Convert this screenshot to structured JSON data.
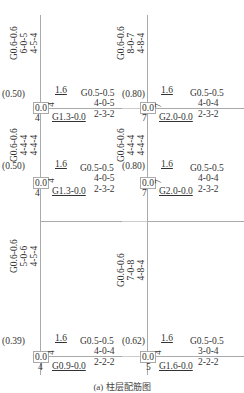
{
  "figure": {
    "caption": "(a) 柱层配筋图"
  },
  "columns": [
    {
      "side": "left",
      "segments": [
        {
          "vertical_label": [
            "G0.6-0.6",
            "6-0-5",
            "4-5-4"
          ]
        },
        {
          "vertical_label": [
            "G0.6-0.6",
            "4-4-4",
            "4-4-4"
          ]
        },
        {
          "vertical_label": [
            "G0.6-0.6",
            "5-0-6",
            "4-5-4"
          ]
        }
      ],
      "joints": [
        {
          "ratio": "(0.50)",
          "box": "0.0",
          "top_small": "1.6",
          "side_small": "4",
          "bottom_small": "4",
          "beam_bottom": "G1.3-0.0",
          "beam_label": [
            "G0.5-0.5",
            "4-0-5",
            "2-3-2"
          ]
        },
        {
          "ratio": "(0.50)",
          "box": "0.0",
          "top_small": "1.6",
          "side_small": "4",
          "bottom_small": "4",
          "beam_bottom": "G1.3-0.0",
          "beam_label": [
            "G0.5-0.5",
            "4-0-5",
            "2-3-2"
          ]
        },
        {
          "ratio": "(0.39)",
          "box": "0.0",
          "top_small": "1.6",
          "side_small": "4",
          "bottom_small": "4",
          "beam_bottom": "G0.9-0.0",
          "beam_label": [
            "G0.5-0.5",
            "4-0-4",
            "2-2-2"
          ]
        }
      ]
    },
    {
      "side": "right",
      "segments": [
        {
          "vertical_label": [
            "G0.6-0.6",
            "8-0-7",
            "4-8-4"
          ]
        },
        {
          "vertical_label": [
            "G0.6-0.6",
            "4-4-4",
            "4-4-4"
          ]
        },
        {
          "vertical_label": [
            "G0.6-0.6",
            "7-0-8",
            "4-8-4"
          ]
        }
      ],
      "joints": [
        {
          "ratio": "(0.80)",
          "box": "0.0",
          "top_small": "1.6",
          "side_small": "7",
          "bottom_small": "7",
          "beam_bottom": "G2.0-0.0",
          "beam_label": [
            "G0.5-0.5",
            "4-0-4",
            "2-3-2"
          ]
        },
        {
          "ratio": "(0.80)",
          "box": "0.0",
          "top_small": "1.6",
          "side_small": "7",
          "bottom_small": "7",
          "beam_bottom": "G2.0-0.0",
          "beam_label": [
            "G0.5-0.5",
            "4-0-4",
            "2-3-2"
          ]
        },
        {
          "ratio": "(0.62)",
          "box": "0.0",
          "top_small": "1.6",
          "side_small": "4",
          "bottom_small": "5",
          "beam_bottom": "G1.6-0.0",
          "beam_label": [
            "G0.5-0.5",
            "3-0-4",
            "2-2-2"
          ]
        }
      ]
    }
  ]
}
